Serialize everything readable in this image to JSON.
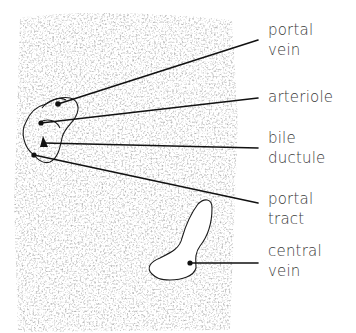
{
  "diagram": {
    "colors": {
      "background": "#ffffff",
      "tissue_texture": "#9a9a9a",
      "lines": "#1a1a1a",
      "label_text": "#3a3a3a"
    },
    "labels": [
      {
        "id": "portal-vein",
        "lines": [
          "portal",
          "vein"
        ],
        "anchor": [
          60,
          103
        ],
        "target": [
          258,
          40
        ]
      },
      {
        "id": "arteriole",
        "lines": [
          "arteriole"
        ],
        "anchor": [
          40,
          123
        ],
        "target": [
          258,
          98
        ]
      },
      {
        "id": "bile-ductule",
        "lines": [
          "bile",
          "ductule"
        ],
        "anchor": [
          43,
          143
        ],
        "target": [
          258,
          148
        ]
      },
      {
        "id": "portal-tract",
        "lines": [
          "portal",
          "tract"
        ],
        "anchor": [
          34,
          155
        ],
        "target": [
          258,
          203
        ]
      },
      {
        "id": "central-vein",
        "lines": [
          "central",
          "vein"
        ],
        "anchor": [
          190,
          263
        ],
        "target": [
          258,
          263
        ]
      }
    ]
  }
}
